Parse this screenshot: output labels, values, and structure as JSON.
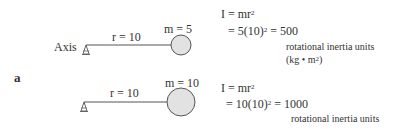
{
  "panel_label": "a",
  "axis_label": "Axis",
  "example1": {
    "radius_label": "r = 10",
    "mass_label": "m = 5",
    "formula_line1_pre": "I = mr",
    "formula_line1_exp": "2",
    "formula_line2_pre": "= 5(10)",
    "formula_line2_exp": "2",
    "formula_line2_post": " = 500",
    "units_line1": "rotational inertia units",
    "units_line2_pre": "(kg • m",
    "units_line2_exp": "2",
    "units_line2_post": ")"
  },
  "example2": {
    "radius_label": "r = 10",
    "mass_label": "m = 10",
    "formula_line1_pre": "I = mr",
    "formula_line1_exp": "2",
    "formula_line2_pre": "= 10(10)",
    "formula_line2_exp": "2",
    "formula_line2_post": " = 1000",
    "units_line1": "rotational inertia units"
  },
  "colors": {
    "line": "#555555",
    "mass_fill": "#e2e2e2",
    "mass_stroke": "#555555",
    "text": "#333333"
  }
}
